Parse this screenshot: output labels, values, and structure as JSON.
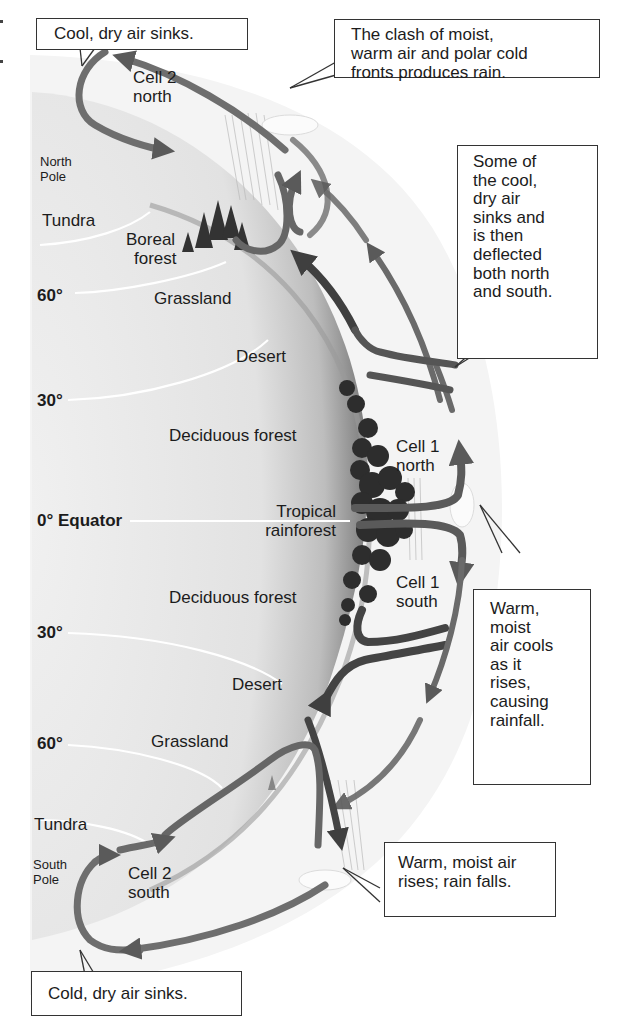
{
  "latitude_labels": {
    "north_60": "60°",
    "north_30": "30°",
    "equator": "0° Equator",
    "south_30": "30°",
    "south_60": "60°"
  },
  "poles": {
    "north": [
      "North",
      "Pole"
    ],
    "south": [
      "South",
      "Pole"
    ]
  },
  "biomes": {
    "tundra_north": "Tundra",
    "boreal_forest": [
      "Boreal",
      "forest"
    ],
    "grassland_north": "Grassland",
    "desert_north": "Desert",
    "deciduous_north": "Deciduous forest",
    "tropical_rainforest": [
      "Tropical",
      "rainforest"
    ],
    "deciduous_south": "Deciduous forest",
    "desert_south": "Desert",
    "grassland_south": "Grassland",
    "tundra_south": "Tundra"
  },
  "cells": {
    "cell2_north": [
      "Cell 2",
      "north"
    ],
    "cell1_north": [
      "Cell 1",
      "north"
    ],
    "cell1_south": [
      "Cell 1",
      "south"
    ],
    "cell2_south": [
      "Cell 2",
      "south"
    ]
  },
  "callouts": {
    "cool_dry_sinks": "Cool, dry air sinks.",
    "clash": [
      "The clash of moist,",
      "warm air and polar cold",
      "fronts produces rain."
    ],
    "deflected": [
      "Some of",
      "the cool,",
      "dry air",
      "sinks and",
      "is then",
      "deflected",
      "both north",
      "and south."
    ],
    "warm_moist_cools": [
      "Warm,",
      "moist",
      "air cools",
      "as it",
      "rises,",
      "causing",
      "rainfall."
    ],
    "warm_moist_rises": [
      "Warm, moist air",
      "rises; rain falls."
    ],
    "cold_dry_sinks": "Cold, dry air sinks."
  },
  "colors": {
    "arrow": "#6e6e6e",
    "arrow_dark": "#4a4a4a",
    "earth_light": "#ececec",
    "earth_shadow": "#8a8a8a",
    "trees": "#2f2f2f",
    "border": "#333333"
  }
}
